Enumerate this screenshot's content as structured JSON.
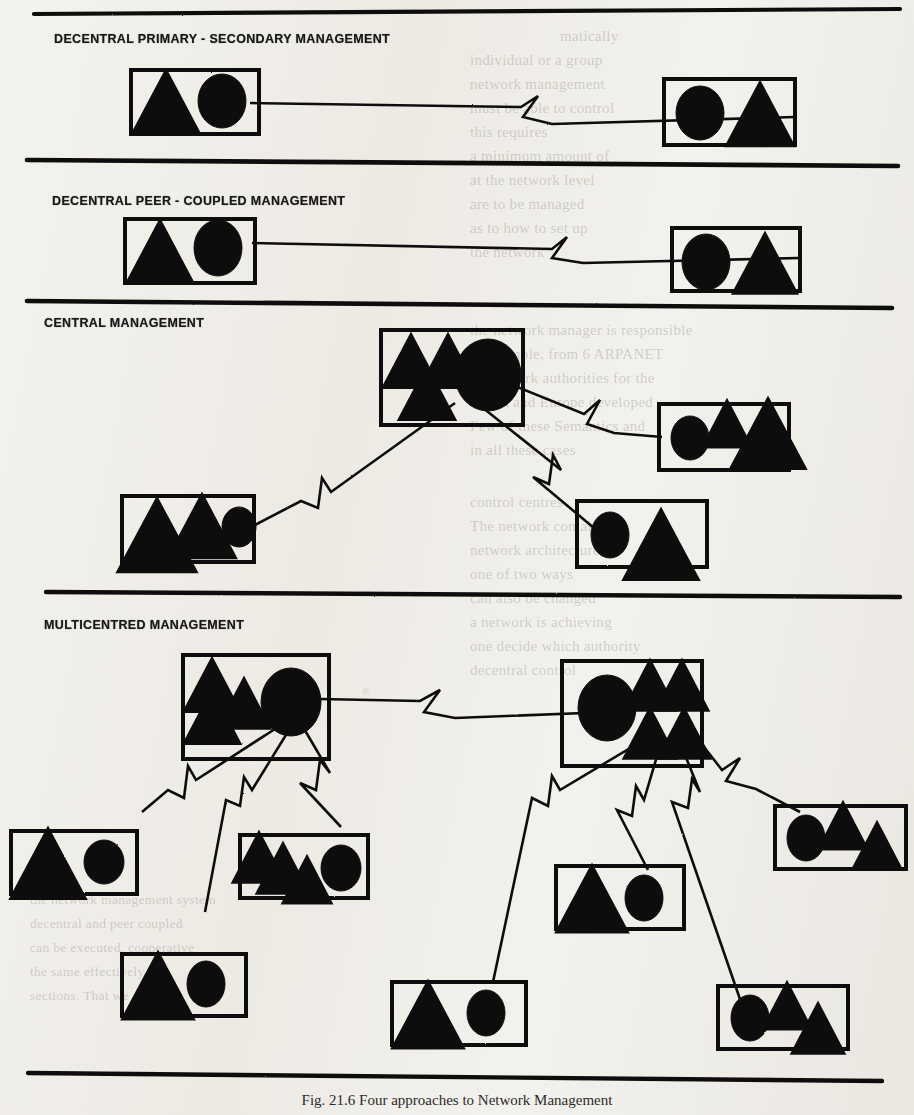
{
  "figure": {
    "caption": "Fig. 21.6   Four approaches to Network Management",
    "panels": [
      {
        "id": "decentral-primary-secondary",
        "title": "DECENTRAL PRIMARY - SECONDARY MANAGEMENT"
      },
      {
        "id": "decentral-peer-coupled",
        "title": "DECENTRAL PEER - COUPLED MANAGEMENT"
      },
      {
        "id": "central",
        "title": "CENTRAL MANAGEMENT"
      },
      {
        "id": "multicentred",
        "title": "MULTICENTRED MANAGEMENT"
      }
    ],
    "legend": {
      "circle": "management-node",
      "triangle": "managed-device",
      "zigzag-line": "network-link"
    },
    "colors": {
      "ink": "#111111",
      "paper": "#f2f0ec"
    }
  },
  "bleed_text": {
    "right_column": [
      "matically",
      "individual or a group",
      "network management",
      "must be able to control",
      "this requires",
      "a minimum amount of",
      "at the network level",
      "are to be managed",
      "as to how to set up",
      "the network",
      "the network manager is responsible",
      "or example, from 6 ARPANET",
      "of network authorities for the",
      "ARPA and Europe developed",
      "Few of these Semantics  and",
      "in all these cases",
      "control centres",
      "The network contains",
      "network architectures",
      "one of two ways",
      "can also be changed",
      "a network is achieving",
      "one decide which authority",
      "decentral control",
      "who does this only if",
      "replicated"
    ],
    "lower_column": [
      "the network management system",
      "decentral and peer coupled",
      "can be executed, cooperative",
      "the same effectively",
      "sections. That we call"
    ]
  }
}
